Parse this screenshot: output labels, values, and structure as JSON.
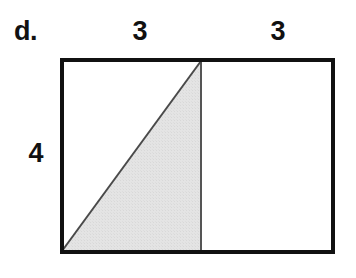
{
  "figure": {
    "item_marker": "d.",
    "labels": {
      "top_left_width": "3",
      "top_right_width": "3",
      "left_height": "4"
    },
    "colors": {
      "background": "#ffffff",
      "outline": "#111111",
      "shaded_fill": "#e2e2e2",
      "shaded_edge": "#4a4a4a",
      "divider": "#555555",
      "text": "#111111"
    },
    "geometry": {
      "rect_left": 60,
      "rect_top": 58,
      "rect_right": 335,
      "rect_bottom": 254,
      "outline_width": 4,
      "divider_x": 201,
      "divider_width": 2,
      "diagonal_from": "bottom-left-corner",
      "diagonal_to": "top-of-divider",
      "diagonal_width": 2
    },
    "shapes": {
      "outer_rectangle": "rectangle",
      "divider_line": "vertical-line",
      "diagonal_line": "diagonal-line",
      "shaded_region": "right-triangle"
    }
  }
}
